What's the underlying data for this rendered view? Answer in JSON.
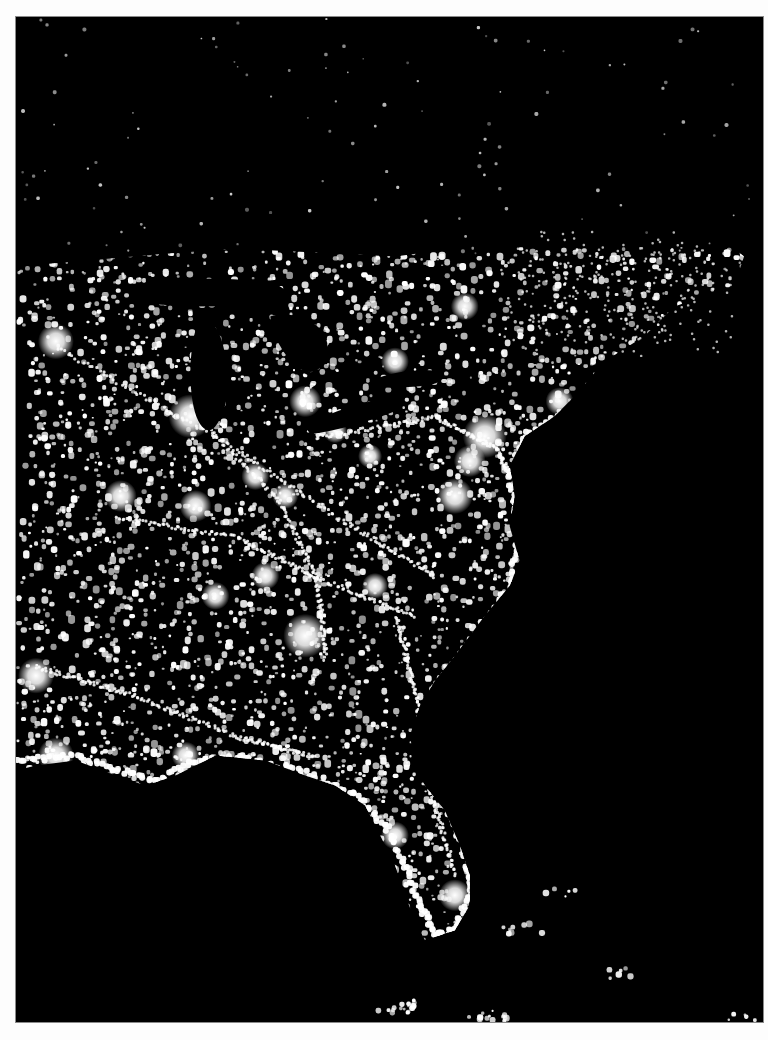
{
  "image": {
    "subject": "Satellite photograph of the eastern United States at night showing city lights",
    "alt": "Night-time satellite view of city lights across the eastern United States, Great Lakes and Florida",
    "colors": {
      "page_background": "#fdfdfd",
      "night_background": "#000000",
      "light": "#ffffff",
      "frame_border": "#8a8a8a"
    }
  },
  "regions": {
    "landmass": "Eastern United States",
    "lakes": [
      "Lake Superior",
      "Lake Michigan",
      "Lake Huron",
      "Lake Erie",
      "Lake Ontario"
    ],
    "features": [
      "Florida peninsula",
      "Gulf Coast",
      "Atlantic seaboard",
      "Southeastern Canada",
      "Bahamas / Cuba lights"
    ]
  },
  "metro_glows": [
    "Chicago",
    "Detroit",
    "Cleveland",
    "Pittsburgh",
    "New York",
    "Boston",
    "Philadelphia",
    "Washington DC",
    "Atlanta",
    "St. Louis",
    "Kansas City",
    "Minneapolis",
    "Memphis",
    "Nashville",
    "Houston",
    "New Orleans",
    "Miami",
    "Tampa",
    "Charlotte",
    "Toronto",
    "Montreal",
    "Dallas",
    "Indianapolis",
    "Cincinnati"
  ]
}
